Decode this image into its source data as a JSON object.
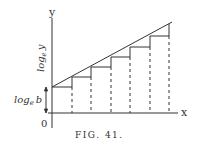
{
  "figure": {
    "caption": "FIG. 41.",
    "axis_x_label": "x",
    "axis_y_label": "y",
    "origin_label": "0",
    "y_axis_annotation": "log_e y",
    "intercept_annotation": "log_e b",
    "colors": {
      "ink": "#333333",
      "background": "#ffffff"
    }
  },
  "labels": {
    "log_main": "log",
    "sub_e": "e",
    "y_var": "y",
    "b_var": "b"
  }
}
